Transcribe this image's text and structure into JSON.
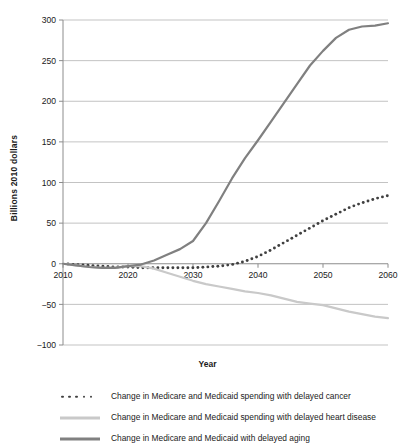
{
  "chart_data": {
    "type": "line",
    "title": "",
    "xlabel": "Year",
    "ylabel": "Billions 2010 dollars",
    "xlim": [
      2010,
      2060
    ],
    "ylim": [
      -100,
      300
    ],
    "xticks": [
      2010,
      2020,
      2030,
      2040,
      2050,
      2060
    ],
    "yticks": [
      -100,
      -50,
      0,
      50,
      100,
      150,
      200,
      250,
      300
    ],
    "grid": "horizontal",
    "legend_position": "bottom",
    "x": [
      2010,
      2012,
      2014,
      2016,
      2018,
      2020,
      2022,
      2024,
      2026,
      2028,
      2030,
      2032,
      2034,
      2036,
      2038,
      2040,
      2042,
      2044,
      2046,
      2048,
      2050,
      2052,
      2054,
      2056,
      2058,
      2060
    ],
    "series": [
      {
        "name": "Change in Medicare and Medicaid spending with delayed cancer",
        "style": "dotted",
        "color": "#404040",
        "values": [
          0,
          -1,
          -2,
          -3,
          -4,
          -4,
          -5,
          -5,
          -5,
          -5,
          -5,
          -4,
          -3,
          -1,
          3,
          9,
          17,
          26,
          35,
          44,
          53,
          61,
          69,
          75,
          80,
          84
        ]
      },
      {
        "name": "Change in Medicare and Medicaid spending with delayed heart disease",
        "style": "solid",
        "color": "#c9c9c9",
        "values": [
          0,
          -2,
          -4,
          -5,
          -5,
          -3,
          -3,
          -6,
          -11,
          -16,
          -21,
          -25,
          -28,
          -31,
          -34,
          -36,
          -39,
          -43,
          -47,
          -49,
          -51,
          -55,
          -59,
          -62,
          -65,
          -67
        ]
      },
      {
        "name": "Change in Medicare and Medicaid with delayed aging",
        "style": "solid",
        "color": "#808080",
        "values": [
          0,
          -2,
          -4,
          -5,
          -5,
          -3,
          -1,
          4,
          11,
          18,
          28,
          50,
          77,
          105,
          130,
          152,
          175,
          198,
          221,
          244,
          262,
          278,
          288,
          292,
          293,
          296
        ]
      }
    ]
  },
  "legend": {
    "items": [
      {
        "label": "Change in Medicare and Medicaid spending with delayed cancer",
        "style": "dotted",
        "color": "#404040"
      },
      {
        "label": "Change in Medicare and Medicaid spending with delayed heart disease",
        "style": "solid",
        "color": "#c9c9c9"
      },
      {
        "label": "Change in Medicare and Medicaid with delayed aging",
        "style": "solid",
        "color": "#808080"
      }
    ]
  }
}
